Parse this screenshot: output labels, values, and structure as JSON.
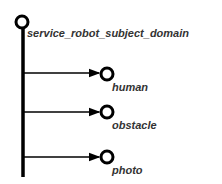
{
  "root": {
    "label": "service_robot_subject_domain"
  },
  "children": [
    {
      "label": "human"
    },
    {
      "label": "obstacle"
    },
    {
      "label": "photo"
    }
  ],
  "colors": {
    "line": "#000000",
    "text": "#333333"
  }
}
